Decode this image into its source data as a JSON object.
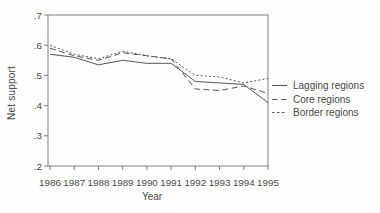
{
  "figure": {
    "background": "#fefefe",
    "ink_color": "#484848",
    "line_color": "#565656",
    "frame_color": "#7e7e7e"
  },
  "chart_data": {
    "type": "line",
    "title": "",
    "xlabel": "Year",
    "ylabel": "Net support",
    "x": [
      "1986",
      "1987",
      "1988",
      "1989",
      "1990",
      "1991",
      "1992",
      "1993",
      "1994",
      "1995"
    ],
    "ylim": [
      0.2,
      0.7
    ],
    "yticks": [
      {
        "value": 0.7,
        "label": ".7"
      },
      {
        "value": 0.6,
        "label": ".6"
      },
      {
        "value": 0.5,
        "label": ".5"
      },
      {
        "value": 0.4,
        "label": ".4"
      },
      {
        "value": 0.3,
        "label": ".3"
      },
      {
        "value": 0.2,
        "label": ".2"
      }
    ],
    "grid": false,
    "legend_position": "right",
    "series": [
      {
        "name": "Lagging regions",
        "style": "solid",
        "values": [
          0.57,
          0.56,
          0.535,
          0.55,
          0.54,
          0.54,
          0.48,
          0.475,
          0.47,
          0.41
        ]
      },
      {
        "name": "Core regions",
        "style": "dashed-long",
        "values": [
          0.59,
          0.565,
          0.55,
          0.575,
          0.565,
          0.555,
          0.455,
          0.45,
          0.465,
          0.44
        ]
      },
      {
        "name": "Border regions",
        "style": "dashed-short",
        "values": [
          0.6,
          0.57,
          0.555,
          0.58,
          0.565,
          0.555,
          0.5,
          0.495,
          0.475,
          0.49
        ]
      }
    ]
  }
}
